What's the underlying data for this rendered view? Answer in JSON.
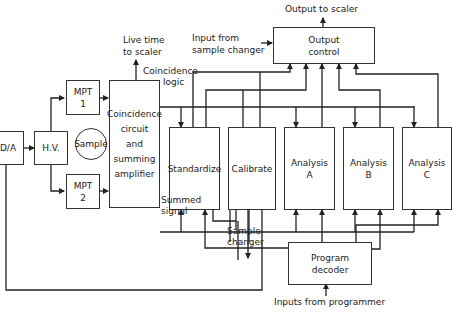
{
  "diagram": {
    "type": "block-diagram",
    "blocks": {
      "da": "D/A",
      "hv": "H.V.",
      "mpt1": [
        "MPT",
        "1"
      ],
      "mpt2": [
        "MPT",
        "2"
      ],
      "sample": "Sample",
      "coincidence": [
        "Coincidence",
        "circuit",
        "and",
        "summing",
        "amplifier"
      ],
      "standardize": "Standardize",
      "calibrate": "Calibrate",
      "analysis_a": [
        "Analysis",
        "A"
      ],
      "analysis_b": [
        "Analysis",
        "B"
      ],
      "analysis_c": [
        "Analysis",
        "C"
      ],
      "output_control": [
        "Output",
        "control"
      ],
      "program_decoder": [
        "Program",
        "decoder"
      ]
    },
    "labels": {
      "output_to_scaler": "Output to scaler",
      "input_from_sample_changer": [
        "Input from",
        "sample changer"
      ],
      "live_time": [
        "Live time",
        "to scaler"
      ],
      "coincidence_logic": [
        "Coincidence",
        "logic"
      ],
      "summed_signal": [
        "Summed",
        "signal"
      ],
      "sample_changer": [
        "Sample",
        "changer"
      ],
      "inputs_from_programmer": "Inputs from programmer"
    }
  }
}
